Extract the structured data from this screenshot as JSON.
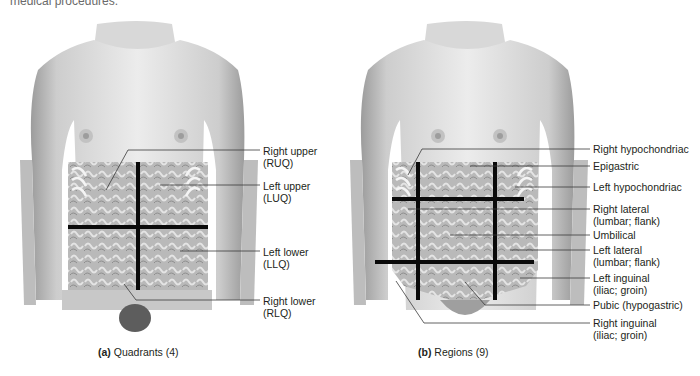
{
  "top_fragment": "medical procedures.",
  "panel_a": {
    "caption_letter": "(a)",
    "caption_text": "Quadrants (4)",
    "labels": [
      {
        "line1": "Right upper",
        "line2": "(RUQ)"
      },
      {
        "line1": "Left upper",
        "line2": "(LUQ)"
      },
      {
        "line1": "Left lower",
        "line2": "(LLQ)"
      },
      {
        "line1": "Right lower",
        "line2": "(RLQ)"
      }
    ]
  },
  "panel_b": {
    "caption_letter": "(b)",
    "caption_text": "Regions (9)",
    "labels": [
      {
        "line1": "Right hypochondriac",
        "line2": ""
      },
      {
        "line1": "Epigastric",
        "line2": ""
      },
      {
        "line1": "Left hypochondriac",
        "line2": ""
      },
      {
        "line1": "Right lateral",
        "line2": "(lumbar; flank)"
      },
      {
        "line1": "Umbilical",
        "line2": ""
      },
      {
        "line1": "Left lateral",
        "line2": "(lumbar; flank)"
      },
      {
        "line1": "Left inguinal",
        "line2": "(iliac; groin)"
      },
      {
        "line1": "Pubic (hypogastric)",
        "line2": ""
      },
      {
        "line1": "Right inguinal",
        "line2": "(iliac; groin)"
      }
    ]
  },
  "colors": {
    "skin_light": "#e6e6e6",
    "skin_mid": "#cfcfcf",
    "skin_dark": "#a9a9a9",
    "viscera": "#b5b5b5",
    "grid_line": "#0a0a0a",
    "leader_line": "#3a3a3a"
  }
}
